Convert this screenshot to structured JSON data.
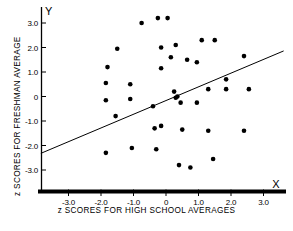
{
  "chart_data": {
    "type": "scatter",
    "title": "",
    "xlabel": "z SCORES FOR HIGH SCHOOL AVERAGES",
    "ylabel": "z SCORES FOR FRESHMAN AVERAGE",
    "x_axis_name": "X",
    "y_axis_name": "Y",
    "xlim": [
      -3.85,
      3.7
    ],
    "ylim": [
      -3.85,
      3.55
    ],
    "grid": false,
    "legend": null,
    "xticks": [
      -3.0,
      -2.0,
      -1.0,
      0,
      1.0,
      2.0,
      3.0
    ],
    "xtick_labels": [
      "-3.0",
      "-2.0",
      "-1.0",
      "0",
      "1.0",
      "2.0",
      "3.0"
    ],
    "yticks": [
      3.0,
      2.0,
      1.0,
      0,
      -1.0,
      -2.0,
      -3.0
    ],
    "ytick_labels": [
      "3.0",
      "2.0",
      "1.0",
      "0",
      "-1.0",
      "-2.0",
      "-3.0"
    ],
    "points": [
      [
        -0.75,
        3.0
      ],
      [
        -0.25,
        3.2
      ],
      [
        0.05,
        3.2
      ],
      [
        -1.5,
        1.95
      ],
      [
        -0.15,
        2.0
      ],
      [
        0.3,
        2.1
      ],
      [
        1.1,
        2.3
      ],
      [
        1.5,
        2.3
      ],
      [
        -1.8,
        1.2
      ],
      [
        -0.15,
        1.15
      ],
      [
        0.15,
        1.6
      ],
      [
        0.65,
        1.5
      ],
      [
        0.95,
        1.4
      ],
      [
        2.4,
        1.65
      ],
      [
        -1.85,
        0.55
      ],
      [
        -1.1,
        0.5
      ],
      [
        1.85,
        0.7
      ],
      [
        -1.85,
        -0.15
      ],
      [
        -1.1,
        -0.1
      ],
      [
        0.25,
        0.2
      ],
      [
        0.3,
        -0.05
      ],
      [
        0.35,
        0.0
      ],
      [
        1.3,
        0.3
      ],
      [
        1.85,
        0.3
      ],
      [
        2.55,
        0.3
      ],
      [
        -1.55,
        -0.8
      ],
      [
        -0.4,
        -0.4
      ],
      [
        0.45,
        -0.25
      ],
      [
        0.95,
        -0.25
      ],
      [
        -0.35,
        -1.3
      ],
      [
        -0.15,
        -1.2
      ],
      [
        0.5,
        -1.35
      ],
      [
        1.3,
        -1.4
      ],
      [
        2.4,
        -1.4
      ],
      [
        -1.85,
        -2.3
      ],
      [
        -1.05,
        -2.1
      ],
      [
        -0.3,
        -2.15
      ],
      [
        0.4,
        -2.8
      ],
      [
        0.75,
        -2.9
      ],
      [
        1.45,
        -2.55
      ]
    ],
    "regression_line": {
      "x_start": -3.85,
      "y_start": -2.32,
      "x_end": 3.62,
      "y_end": 1.86,
      "slope": 0.56,
      "intercept": -0.17
    }
  }
}
